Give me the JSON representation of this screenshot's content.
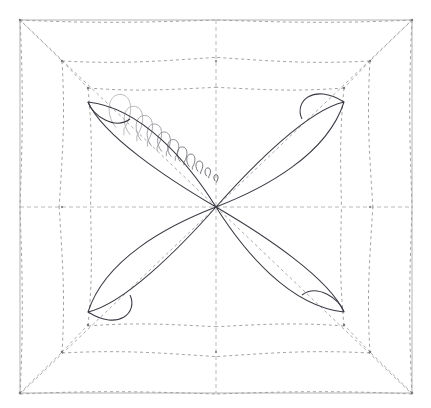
{
  "figure": {
    "type": "geometric-diagram",
    "canvas": {
      "width": 431,
      "height": 408,
      "background": "#ffffff"
    },
    "colors": {
      "border": "#b4b4b4",
      "axis_dashed": "#b9b9b9",
      "envelope_dashed": "#9a9a9a",
      "petal_solid": "#3a3a44",
      "spiral_fade_start": "#b8b8bd",
      "spiral_fade_end": "#5a5a62",
      "node_marker": "#7a7a80"
    },
    "border_box": {
      "x": 20,
      "y": 20,
      "width": 392,
      "height": 373,
      "stroke_width": 1
    },
    "center": {
      "x": 216,
      "y": 207
    },
    "axes": [
      {
        "name": "horizontal-axis",
        "orientation": "horizontal",
        "y": 207,
        "x1": 20,
        "x2": 412,
        "dash": "4 3"
      },
      {
        "name": "vertical-axis",
        "orientation": "vertical",
        "x": 216,
        "y1": 20,
        "y2": 393,
        "dash": "4 3"
      }
    ],
    "corner_nodes": [
      {
        "name": "node-top-left",
        "x": 20,
        "y": 20
      },
      {
        "name": "node-top-right",
        "x": 412,
        "y": 20
      },
      {
        "name": "node-bottom-left",
        "x": 20,
        "y": 393
      },
      {
        "name": "node-bottom-right",
        "x": 412,
        "y": 393
      }
    ],
    "inner_nodes": [
      {
        "name": "node-ul-outer",
        "x": 62,
        "y": 61
      },
      {
        "name": "node-ul-inner",
        "x": 88,
        "y": 88
      },
      {
        "name": "node-ur-outer",
        "x": 370,
        "y": 61
      },
      {
        "name": "node-ur-inner",
        "x": 344,
        "y": 88
      },
      {
        "name": "node-ll-outer",
        "x": 62,
        "y": 352
      },
      {
        "name": "node-ll-inner",
        "x": 88,
        "y": 325
      },
      {
        "name": "node-lr-outer",
        "x": 370,
        "y": 352
      },
      {
        "name": "node-lr-inner",
        "x": 344,
        "y": 325
      }
    ],
    "petals": [
      {
        "name": "petal-upper-left",
        "quadrant": "upper-left",
        "tip": {
          "x": 88,
          "y": 102
        },
        "crossing": {
          "x": 130,
          "y": 119
        },
        "center_end": {
          "x": 216,
          "y": 207
        },
        "outer_bulge": 30,
        "stroke_width": 1.05
      },
      {
        "name": "petal-upper-right",
        "quadrant": "upper-right",
        "tip": {
          "x": 344,
          "y": 102
        },
        "crossing": {
          "x": 302,
          "y": 119
        },
        "center_end": {
          "x": 216,
          "y": 207
        },
        "outer_bulge": 30,
        "stroke_width": 1.05
      },
      {
        "name": "petal-lower-left",
        "quadrant": "lower-left",
        "tip": {
          "x": 88,
          "y": 312
        },
        "crossing": {
          "x": 130,
          "y": 295
        },
        "center_end": {
          "x": 216,
          "y": 207
        },
        "outer_bulge": 30,
        "stroke_width": 1.05
      },
      {
        "name": "petal-lower-right",
        "quadrant": "lower-right",
        "tip": {
          "x": 344,
          "y": 312
        },
        "crossing": {
          "x": 302,
          "y": 295
        },
        "center_end": {
          "x": 216,
          "y": 207
        },
        "outer_bulge": 30,
        "stroke_width": 1.05
      }
    ],
    "envelope_curves": {
      "count_per_quadrant": 3,
      "dash": "3 3",
      "stroke_width": 0.9,
      "description": "Dashed concave arcs spanning from box corners and inner nodes to the axis midpoints, forming a four-pointed star envelope."
    },
    "spiral_loops": {
      "name": "fading-spiral-loops",
      "count": 11,
      "from": {
        "x": 120,
        "y": 112
      },
      "to": {
        "x": 216,
        "y": 178
      },
      "start_size": 21,
      "end_size": 4,
      "description": "Sequence of progressively shrinking teardrop loops running from the upper-left petal toward the center, fading from light gray to darker gray."
    },
    "tick_marks": {
      "name": "axis-tick-nodes",
      "positions": [
        {
          "x": 216,
          "y": 61
        },
        {
          "x": 216,
          "y": 352
        },
        {
          "x": 62,
          "y": 207
        },
        {
          "x": 370,
          "y": 207
        }
      ]
    }
  },
  "chart_data": {
    "type": "scatter",
    "xlabel": "",
    "ylabel": "",
    "xlim": [
      -1,
      1
    ],
    "ylim": [
      -1,
      1
    ],
    "grid": false,
    "legend": "none",
    "series": [
      {
        "name": "petal-upper-left",
        "kind": "closed-loop",
        "points": [
          [
            0,
            0
          ],
          [
            -0.33,
            -0.27
          ],
          [
            -0.65,
            -0.54
          ],
          [
            -0.44,
            -0.45
          ],
          [
            0,
            0
          ]
        ]
      },
      {
        "name": "petal-upper-right",
        "kind": "closed-loop",
        "points": [
          [
            0,
            0
          ],
          [
            0.33,
            -0.27
          ],
          [
            0.65,
            -0.54
          ],
          [
            0.44,
            -0.45
          ],
          [
            0,
            0
          ]
        ]
      },
      {
        "name": "petal-lower-left",
        "kind": "closed-loop",
        "points": [
          [
            0,
            0
          ],
          [
            -0.33,
            0.27
          ],
          [
            -0.65,
            0.54
          ],
          [
            -0.44,
            0.45
          ],
          [
            0,
            0
          ]
        ]
      },
      {
        "name": "petal-lower-right",
        "kind": "closed-loop",
        "points": [
          [
            0,
            0
          ],
          [
            0.33,
            0.27
          ],
          [
            0.65,
            0.54
          ],
          [
            0.44,
            0.45
          ],
          [
            0,
            0
          ]
        ]
      }
    ],
    "annotations": [
      {
        "name": "center-origin",
        "x": 0,
        "y": 0
      },
      {
        "name": "bounding-square",
        "x": [
          -1,
          1
        ],
        "y": [
          -1,
          1
        ]
      }
    ]
  }
}
